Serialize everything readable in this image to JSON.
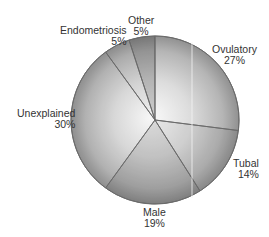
{
  "chart_data": {
    "type": "pie",
    "title": "",
    "start_angle_deg": 0,
    "direction": "clockwise",
    "slices": [
      {
        "label": "Ovulatory",
        "value": 27,
        "display": "27%"
      },
      {
        "label": "Tubal",
        "value": 14,
        "display": "14%"
      },
      {
        "label": "Male",
        "value": 19,
        "display": "19%"
      },
      {
        "label": "Unexplained",
        "value": 30,
        "display": "30%"
      },
      {
        "label": "Endometriosis",
        "value": 5,
        "display": "5%"
      },
      {
        "label": "Other",
        "value": 5,
        "display": "5%"
      }
    ],
    "legend": "none",
    "style": "grayscale shaded sphere"
  },
  "labels": {
    "ovulatory": {
      "name": "Ovulatory",
      "pct": "27%"
    },
    "tubal": {
      "name": "Tubal",
      "pct": "14%"
    },
    "male": {
      "name": "Male",
      "pct": "19%"
    },
    "unexplained": {
      "name": "Unexplained",
      "pct": "30%"
    },
    "endometriosis": {
      "name": "Endometriosis",
      "pct": "5%"
    },
    "other": {
      "name": "Other",
      "pct": "5%"
    }
  },
  "colors": {
    "edge": "#6a6a6a",
    "highlight": "#fafafa",
    "shade": "#8e8e8e",
    "text": "#333333"
  }
}
